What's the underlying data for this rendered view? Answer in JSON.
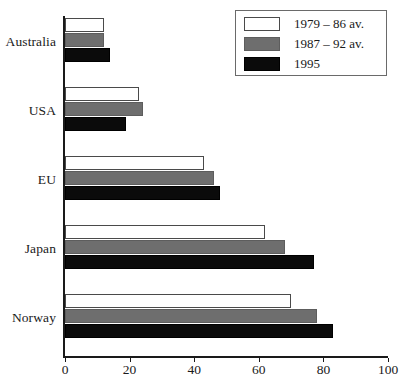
{
  "chart_data": {
    "type": "bar",
    "orientation": "horizontal",
    "title": "",
    "xlabel": "",
    "ylabel": "",
    "xlim": [
      0,
      100
    ],
    "xticks": [
      0,
      20,
      40,
      60,
      80,
      100
    ],
    "grid": false,
    "legend_position": "top-right",
    "categories": [
      "Australia",
      "USA",
      "EU",
      "Japan",
      "Norway"
    ],
    "series": [
      {
        "name": "1979 – 86 av.",
        "color": "#ffffff",
        "swatch": "white-outlined",
        "values": [
          12,
          23,
          43,
          62,
          70
        ]
      },
      {
        "name": "1987 – 92 av.",
        "color": "#6e6e6e",
        "swatch": "grey",
        "values": [
          12,
          24,
          46,
          68,
          78
        ]
      },
      {
        "name": "1995",
        "color": "#0b0b0b",
        "swatch": "black",
        "values": [
          14,
          19,
          48,
          77,
          83
        ]
      }
    ]
  },
  "axis": {
    "tick_labels": [
      "0",
      "20",
      "40",
      "60",
      "80",
      "100"
    ]
  },
  "legend": {
    "entries": [
      {
        "label": "1979 – 86 av."
      },
      {
        "label": "1987 – 92 av."
      },
      {
        "label": "1995"
      }
    ]
  },
  "categories": [
    {
      "label": "Australia"
    },
    {
      "label": "USA"
    },
    {
      "label": "EU"
    },
    {
      "label": "Japan"
    },
    {
      "label": "Norway"
    }
  ]
}
